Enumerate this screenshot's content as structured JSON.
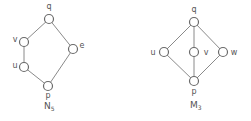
{
  "diagrams": [
    {
      "name": "N5",
      "title": "N",
      "title_sub": "5",
      "nodes": [
        {
          "id": "q",
          "label": "q",
          "x": 49,
          "y": 19,
          "lx": 49,
          "ly": 9,
          "anchor": "middle"
        },
        {
          "id": "v",
          "label": "v",
          "x": 24,
          "y": 42,
          "lx": 15,
          "ly": 42,
          "anchor": "middle"
        },
        {
          "id": "u",
          "label": "u",
          "x": 24,
          "y": 67,
          "lx": 15,
          "ly": 68,
          "anchor": "middle"
        },
        {
          "id": "e",
          "label": "e",
          "x": 73,
          "y": 49,
          "lx": 82,
          "ly": 48,
          "anchor": "middle"
        },
        {
          "id": "p",
          "label": "p",
          "x": 48,
          "y": 86,
          "lx": 48,
          "ly": 98,
          "anchor": "middle"
        }
      ],
      "edges": [
        [
          "q",
          "v"
        ],
        [
          "v",
          "u"
        ],
        [
          "u",
          "p"
        ],
        [
          "q",
          "e"
        ],
        [
          "e",
          "p"
        ]
      ],
      "title_x": 44,
      "title_y": 109
    },
    {
      "name": "M3",
      "title": "M",
      "title_sub": "3",
      "nodes": [
        {
          "id": "q",
          "label": "q",
          "x": 194,
          "y": 22,
          "lx": 194,
          "ly": 12,
          "anchor": "middle"
        },
        {
          "id": "u",
          "label": "u",
          "x": 164,
          "y": 52,
          "lx": 153,
          "ly": 55,
          "anchor": "middle"
        },
        {
          "id": "v",
          "label": "v",
          "x": 194,
          "y": 52,
          "lx": 206,
          "ly": 55,
          "anchor": "middle"
        },
        {
          "id": "w",
          "label": "w",
          "x": 223,
          "y": 52,
          "lx": 234,
          "ly": 55,
          "anchor": "middle"
        },
        {
          "id": "p",
          "label": "p",
          "x": 194,
          "y": 81,
          "lx": 194,
          "ly": 94,
          "anchor": "middle"
        }
      ],
      "edges": [
        [
          "q",
          "u"
        ],
        [
          "q",
          "v"
        ],
        [
          "q",
          "w"
        ],
        [
          "u",
          "p"
        ],
        [
          "v",
          "p"
        ],
        [
          "w",
          "p"
        ]
      ],
      "title_x": 190,
      "title_y": 108
    }
  ]
}
